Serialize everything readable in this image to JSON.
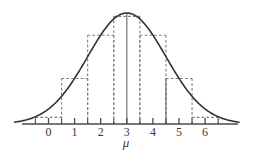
{
  "figure": {
    "name": "normal-distribution-with-histogram",
    "background": "#ffffff",
    "width": 257,
    "height": 157
  },
  "axis": {
    "title": "μ",
    "title_x": 126,
    "title_y": 136,
    "line_y": 124,
    "line_x_start": 22,
    "line_x_end": 238,
    "color": "#4a4a4a",
    "tick_labels": [
      "0",
      "1",
      "2",
      "3",
      "4",
      "5",
      "6"
    ],
    "tick_values": [
      0,
      1,
      2,
      3,
      4,
      5,
      6
    ],
    "tick_label_y": 126,
    "minor_tick_values": [
      -0.5,
      0.5,
      1.5,
      2.5,
      3.5,
      4.5,
      5.5,
      6.5
    ],
    "tick_length_major": 6,
    "tick_length_minor": 5
  },
  "chart_data": {
    "type": "line",
    "title": "",
    "xlabel": "μ",
    "ylabel": "",
    "grid": false,
    "legend": "none",
    "xlim": [
      -1.3,
      7.3
    ],
    "ylim": [
      0,
      1.0
    ],
    "series": [
      {
        "name": "normal-density-curve",
        "type": "line",
        "style": "solid",
        "color": "#333333",
        "distribution": "normal",
        "mean": 3,
        "sigma": 1.5,
        "peak_value": 1.0
      },
      {
        "name": "histogram-bars",
        "type": "bar",
        "style": "dashed",
        "color": "#7d7d7d",
        "bin_edges": [
          -0.5,
          0.5,
          1.5,
          2.5,
          3.5,
          4.5,
          5.5,
          6.5
        ],
        "bin_centers": [
          0,
          1,
          2,
          3,
          4,
          5,
          6
        ],
        "values": [
          0.06,
          0.41,
          0.8,
          0.97,
          0.8,
          0.41,
          0.06
        ]
      }
    ],
    "vertical_reference_lines": [
      {
        "x": 3,
        "style": "solid",
        "height": 1.0
      },
      {
        "x": 4.5,
        "style": "solid",
        "height": 0.41
      }
    ]
  },
  "colors": {
    "curve": "#333333",
    "histogram": "#7d7d7d",
    "axis": "#4a4a4a",
    "text": "#3a3a3a"
  }
}
